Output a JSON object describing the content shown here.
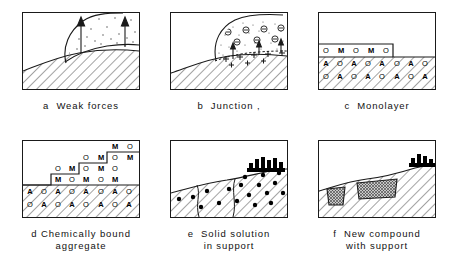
{
  "figure": {
    "panels": [
      {
        "id": "a",
        "caption_letter": "a",
        "caption_line1": "Weak forces",
        "caption_line2": "",
        "description": "Hatched support with dotted deposit layer and two upward arrows"
      },
      {
        "id": "b",
        "caption_letter": "b",
        "caption_line1": "Junction ,",
        "caption_line2": "",
        "description": "Dotted deposit with circled negative charges and positive charges at interface"
      },
      {
        "id": "c",
        "caption_letter": "c",
        "caption_line1": "Monolayer",
        "caption_line2": "",
        "description": "Single stepped layer of O and M atoms above A/O support lattice"
      },
      {
        "id": "d",
        "caption_letter": "d",
        "caption_line1": "Chemically bound",
        "caption_line2": "aggregate",
        "description": "Staircase aggregate of O and M atoms bound to A/O support lattice"
      },
      {
        "id": "e",
        "caption_letter": "e",
        "caption_line1": "Solid solution",
        "caption_line2": "in support",
        "description": "Hatched support containing dispersed black particles and a surface crystallite cluster"
      },
      {
        "id": "f",
        "caption_letter": "f",
        "caption_line1": "New compound",
        "caption_line2": "with support",
        "description": "Hatched support with two cross-hatched compound inclusions and a black surface cluster"
      }
    ],
    "monolayer_grid": {
      "top_row": [
        "O",
        "M",
        "O",
        "M",
        "O"
      ],
      "support_row_1": [
        "A",
        "O",
        "A",
        "O",
        "A",
        "O",
        "A",
        "O"
      ],
      "support_row_2": [
        "O",
        "A",
        "O",
        "A",
        "O",
        "A",
        "O",
        "A"
      ]
    },
    "aggregate_grid": {
      "step_row_1": [
        "M",
        "O"
      ],
      "step_row_2": [
        "O",
        "M",
        "O",
        "M"
      ],
      "step_row_3": [
        "O",
        "M",
        "O",
        "M",
        "O"
      ],
      "step_row_4": [
        "M",
        "O",
        "M",
        "O",
        "M"
      ],
      "support_row_1": [
        "A",
        "O",
        "A",
        "O",
        "A",
        "O",
        "A",
        "O"
      ],
      "support_row_2": [
        "O",
        "A",
        "O",
        "A",
        "O",
        "A",
        "O",
        "A"
      ]
    },
    "colors": {
      "ink": "#1a1a1a",
      "hatch": "#333333",
      "cluster": "#000000",
      "compound_fill": "#b9b9b9",
      "background": "#ffffff"
    }
  }
}
